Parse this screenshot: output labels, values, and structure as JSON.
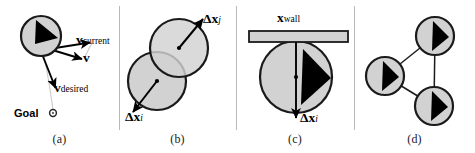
{
  "figure": {
    "width": 475,
    "height": 153,
    "background": "#ffffff",
    "agent_fill": "#d2d2d2",
    "agent_stroke": "#1a1a1a",
    "pointer_fill": "#000000",
    "wall_fill": "#d2d2d2",
    "wall_stroke": "#1a1a1a",
    "divider_color": "#b9b9b9",
    "link_color": "#1a1a1a"
  },
  "panels": [
    {
      "id": "a",
      "label": "(a)",
      "caption_topic": "desired velocity toward goal",
      "labels": {
        "v_current": {
          "symbol": "v",
          "subscript": "current"
        },
        "v": {
          "symbol": "v",
          "subscript": ""
        },
        "v_desired": {
          "symbol": "v",
          "subscript": "desired"
        },
        "goal": "Goal"
      },
      "agents": [
        {
          "cx": 41,
          "cy": 36,
          "r": 20,
          "heading_deg": 35
        }
      ],
      "goal_marker": {
        "cx": 53,
        "cy": 113,
        "r": 3
      },
      "vectors": [
        {
          "name": "v-current-arrow",
          "x1": 49,
          "y1": 49,
          "x2": 93,
          "y2": 42
        },
        {
          "name": "v-arrow",
          "x1": 49,
          "y1": 49,
          "x2": 85,
          "y2": 60
        },
        {
          "name": "v-desired-arrow",
          "x1": 42,
          "y1": 54,
          "x2": 57,
          "y2": 92
        }
      ]
    },
    {
      "id": "b",
      "label": "(b)",
      "caption_topic": "agent-agent overlap displacement",
      "labels": {
        "dx_j": {
          "symbol": "Δx",
          "subscript": "j"
        },
        "dx_i": {
          "symbol": "Δx",
          "subscript": "i"
        }
      },
      "agents": [
        {
          "cx": 179,
          "cy": 48,
          "r": 29,
          "heading_deg": 0
        },
        {
          "cx": 157,
          "cy": 81,
          "r": 29,
          "heading_deg": 0
        }
      ],
      "vectors": [
        {
          "name": "dx-j-arrow",
          "x1": 179,
          "y1": 48,
          "x2": 205,
          "y2": 17
        },
        {
          "name": "dx-i-arrow",
          "x1": 157,
          "y1": 81,
          "x2": 131,
          "y2": 115
        }
      ]
    },
    {
      "id": "c",
      "label": "(c)",
      "caption_topic": "agent-wall overlap displacement",
      "labels": {
        "x_wall": {
          "symbol": "x",
          "subscript": "wall"
        },
        "dx_i": {
          "symbol": "Δx",
          "subscript": "i"
        }
      },
      "agents": [
        {
          "cx": 296,
          "cy": 77,
          "r": 36,
          "heading_deg": 20
        }
      ],
      "wall": {
        "x": 249,
        "y": 32,
        "width": 99,
        "height": 10
      },
      "vectors": [
        {
          "name": "dx-i-arrow",
          "x1": 296,
          "y1": 41,
          "x2": 296,
          "y2": 121
        }
      ]
    },
    {
      "id": "d",
      "label": "(d)",
      "caption_topic": "contact network between agents",
      "labels": {},
      "agents": [
        {
          "cx": 435,
          "cy": 36,
          "r": 19,
          "heading_deg": 0
        },
        {
          "cx": 385,
          "cy": 76,
          "r": 19,
          "heading_deg": 0
        },
        {
          "cx": 434,
          "cy": 106,
          "r": 19,
          "heading_deg": 0
        }
      ],
      "links": [
        {
          "x1": 435,
          "y1": 36,
          "x2": 385,
          "y2": 76
        },
        {
          "x1": 385,
          "y1": 76,
          "x2": 434,
          "y2": 106
        },
        {
          "x1": 435,
          "y1": 36,
          "x2": 434,
          "y2": 106
        }
      ]
    }
  ],
  "dividers": [
    {
      "x": 119
    },
    {
      "x": 236
    },
    {
      "x": 354
    }
  ]
}
